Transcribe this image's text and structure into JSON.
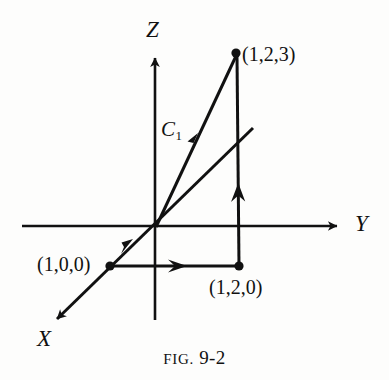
{
  "figure": {
    "caption_prefix": "FIG.",
    "caption_number": "9-2",
    "background_color": "#fdfdfc",
    "ink_color": "#111111"
  },
  "axes": [
    {
      "name": "z-axis",
      "label": "Z"
    },
    {
      "name": "y-axis",
      "label": "Y"
    },
    {
      "name": "x-axis",
      "label": "X"
    }
  ],
  "axis_labels": {
    "z": "Z",
    "y": "Y",
    "x": "X"
  },
  "curve": {
    "label_base": "C",
    "label_subscript": "1"
  },
  "points": [
    {
      "name": "point-1-2-3",
      "label": "(1,2,3)",
      "x": 236,
      "y": 53
    },
    {
      "name": "point-1-2-0",
      "label": "(1,2,0)",
      "x": 239,
      "y": 266
    },
    {
      "name": "point-1-0-0",
      "label": "(1,0,0)",
      "x": 110,
      "y": 266
    }
  ],
  "point_labels": {
    "p123": "(1,2,3)",
    "p120": "(1,2,0)",
    "p100": "(1,0,0)"
  },
  "geometry": {
    "origin": {
      "x": 155,
      "y": 226
    },
    "z_axis_tip": {
      "x": 155,
      "y": 52
    },
    "z_axis_bottom": {
      "x": 155,
      "y": 320
    },
    "y_axis_start": {
      "x": 22,
      "y": 226
    },
    "y_axis_tip": {
      "x": 343,
      "y": 226
    },
    "x_axis_tip": {
      "x": 51,
      "y": 325
    },
    "x_axis_far": {
      "x": 253,
      "y": 128
    }
  }
}
